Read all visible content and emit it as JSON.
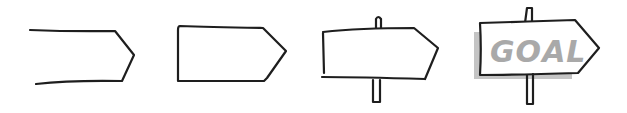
{
  "figure": {
    "steps": [
      {
        "index": 1,
        "label": "open-arrow-outline"
      },
      {
        "index": 2,
        "label": "closed-arrow-board"
      },
      {
        "index": 3,
        "label": "board-with-post"
      },
      {
        "index": 4,
        "label": "finished-sign-with-text-and-shadow"
      }
    ],
    "sign_text": "GOAL",
    "colors": {
      "stroke": "#1e1e1e",
      "text": "#a9a9a9",
      "shadow": "#c4c4c4",
      "background": "#ffffff"
    }
  }
}
